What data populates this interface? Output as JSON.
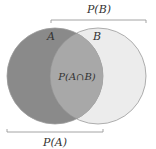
{
  "diagram": {
    "type": "venn",
    "sets": [
      {
        "id": "A",
        "label": "A",
        "fill": "#8a8a8a"
      },
      {
        "id": "B",
        "label": "B",
        "fill": "#ececec"
      }
    ],
    "intersection": {
      "label": "P(A∩B)",
      "fill": "#a8a8a8"
    },
    "brackets": {
      "top": {
        "label": "P(B)"
      },
      "bottom": {
        "label": "P(A)"
      }
    },
    "colors": {
      "outline": "#9a9a9a",
      "bracket": "#9a9a9a",
      "text": "#333333"
    }
  }
}
